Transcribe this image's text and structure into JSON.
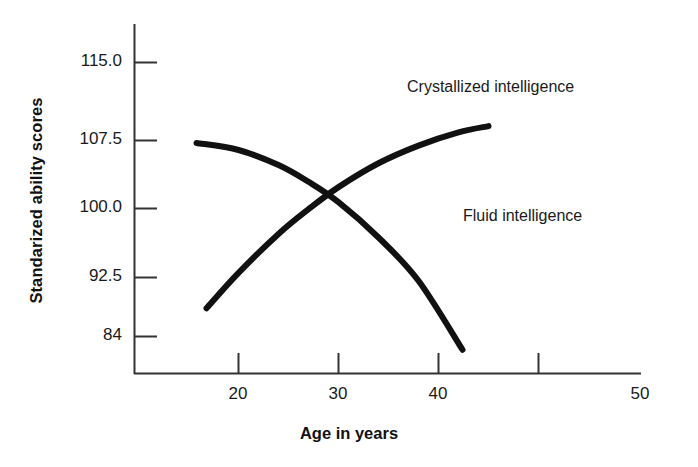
{
  "chart_data": {
    "type": "line",
    "title": "",
    "xlabel": "Age in years",
    "ylabel": "Standarized ability scores",
    "xlim": [
      15,
      50
    ],
    "ylim": [
      80.6,
      118.8
    ],
    "grid": false,
    "legend_position": "inline-annotations",
    "xticks": [
      {
        "value": 20,
        "label": "20"
      },
      {
        "value": 30,
        "label": "30"
      },
      {
        "value": 40,
        "label": "40"
      },
      {
        "value": 50,
        "label": "50"
      }
    ],
    "yticks": [
      {
        "value": 115.0,
        "label": "115.0"
      },
      {
        "value": 107.5,
        "label": "107.5"
      },
      {
        "value": 100.0,
        "label": "100.0"
      },
      {
        "value": 92.5,
        "label": "92.5"
      },
      {
        "value": 84.0,
        "label": "84"
      }
    ],
    "series": [
      {
        "name": "Crystallized intelligence",
        "annotation": "Crystallized intelligence",
        "color": "#111111",
        "x": [
          16.8,
          20,
          24,
          27,
          30,
          34,
          38,
          42,
          45
        ],
        "values": [
          87.2,
          91.2,
          95.6,
          98.4,
          100.9,
          103.6,
          105.6,
          107.1,
          107.8
        ]
      },
      {
        "name": "Fluid intelligence",
        "annotation": "Fluid intelligence",
        "color": "#111111",
        "x": [
          15.8,
          20,
          24,
          27,
          30,
          34,
          38,
          42.4
        ],
        "values": [
          105.9,
          105.1,
          103.4,
          101.5,
          99.2,
          95.2,
          90.3,
          82.5
        ]
      }
    ],
    "annotations": [
      {
        "text": "Crystallized intelligence",
        "x_px": 407,
        "y_px": 78
      },
      {
        "text": "Fluid intelligence",
        "x_px": 463,
        "y_px": 207
      }
    ]
  }
}
